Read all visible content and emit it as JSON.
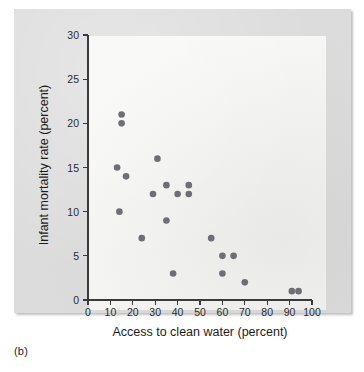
{
  "figure": {
    "panel_caption": "(b)",
    "background_color": "#dcdcdc",
    "panel_color": "#f7f7f5",
    "point_color": "#6e6e76"
  },
  "chart_data": {
    "type": "scatter",
    "title": "",
    "xlabel": "Access to clean water (percent)",
    "ylabel": "Infant mortality rate (percent)",
    "xlim": [
      0,
      100
    ],
    "ylim": [
      0,
      30
    ],
    "xticks": [
      0,
      10,
      20,
      30,
      40,
      50,
      60,
      70,
      80,
      90,
      100
    ],
    "yticks": [
      0,
      5,
      10,
      15,
      20,
      25,
      30
    ],
    "xtick_labels": [
      "0",
      "10",
      "20",
      "30",
      "40",
      "50",
      "60",
      "70",
      "80",
      "90",
      "100"
    ],
    "ytick_labels": [
      "0",
      "5",
      "10",
      "15",
      "20",
      "25",
      "30"
    ],
    "grid": false,
    "legend": null,
    "series": [
      {
        "name": "Countries",
        "points": [
          {
            "x": 15,
            "y": 21
          },
          {
            "x": 15,
            "y": 20
          },
          {
            "x": 13,
            "y": 15
          },
          {
            "x": 17,
            "y": 14
          },
          {
            "x": 14,
            "y": 10
          },
          {
            "x": 24,
            "y": 7
          },
          {
            "x": 31,
            "y": 16
          },
          {
            "x": 29,
            "y": 12
          },
          {
            "x": 35,
            "y": 13
          },
          {
            "x": 35,
            "y": 9
          },
          {
            "x": 40,
            "y": 12
          },
          {
            "x": 38,
            "y": 3
          },
          {
            "x": 45,
            "y": 13
          },
          {
            "x": 45,
            "y": 12
          },
          {
            "x": 55,
            "y": 7
          },
          {
            "x": 60,
            "y": 5
          },
          {
            "x": 65,
            "y": 5
          },
          {
            "x": 60,
            "y": 3
          },
          {
            "x": 70,
            "y": 2
          },
          {
            "x": 91,
            "y": 1
          },
          {
            "x": 94,
            "y": 1
          }
        ]
      }
    ]
  }
}
